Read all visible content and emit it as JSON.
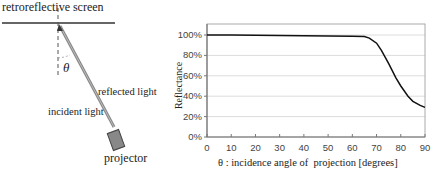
{
  "diagram": {
    "screen_label": "retroreflective screen",
    "angle_label": "θ",
    "reflected_label": "reflected light",
    "incident_label": "incident light",
    "projector_label": "projector"
  },
  "chart_data": {
    "type": "line",
    "title": "",
    "xlabel": "θ : incidence angle of  projection [degrees]",
    "ylabel": "Reflectance",
    "xlim": [
      0,
      90
    ],
    "ylim": [
      0,
      100
    ],
    "x_ticks": [
      "0",
      "10",
      "20",
      "30",
      "40",
      "50",
      "60",
      "70",
      "80",
      "90"
    ],
    "y_ticks": [
      "0%",
      "20%",
      "40%",
      "60%",
      "80%",
      "100%"
    ],
    "grid": true,
    "series": [
      {
        "name": "Reflectance",
        "x": [
          0,
          10,
          20,
          30,
          40,
          50,
          60,
          65,
          67,
          70,
          72,
          75,
          78,
          80,
          83,
          85,
          88,
          90
        ],
        "values": [
          100,
          100,
          99.7,
          99.5,
          99.3,
          99,
          98.7,
          98.5,
          97,
          92,
          85,
          72,
          58,
          50,
          40,
          35,
          31,
          29
        ]
      }
    ],
    "line_color": "#111111",
    "grid_color": "#d9d9d9"
  }
}
